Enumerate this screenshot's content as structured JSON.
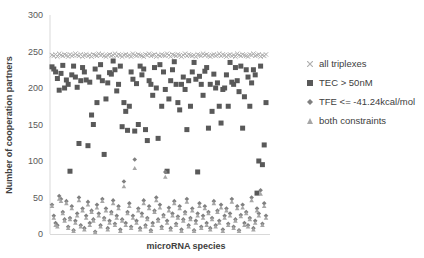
{
  "chart_data": {
    "type": "scatter",
    "title": "",
    "xlabel": "microRNA species",
    "ylabel": "Number of cooperation partners",
    "ylim": [
      0,
      300
    ],
    "yticks": [
      0,
      50,
      100,
      150,
      200,
      250,
      300
    ],
    "grid": false,
    "legend_position": "right",
    "x_count": 120,
    "series": [
      {
        "name": "all triplexes",
        "marker": "x",
        "color": "#b0b0b0",
        "y": [
          245,
          244,
          246,
          243,
          247,
          245,
          244,
          246,
          245,
          243,
          246,
          244,
          245,
          247,
          245,
          244,
          246,
          243,
          245,
          246,
          244,
          245,
          243,
          246,
          245,
          244,
          247,
          245,
          246,
          244,
          243,
          245,
          246,
          244,
          245,
          247,
          244,
          246,
          245,
          243,
          245,
          246,
          244,
          245,
          243,
          247,
          245,
          244,
          246,
          245,
          244,
          243,
          246,
          245,
          247,
          244,
          245,
          246,
          243,
          245,
          244,
          246,
          245,
          244,
          247,
          245,
          243,
          246,
          245,
          244,
          246,
          245,
          243,
          245,
          247,
          244,
          246,
          245,
          244,
          245,
          243,
          246,
          245,
          244,
          247,
          245,
          246,
          244,
          243,
          245,
          246,
          244,
          245,
          247,
          244,
          246,
          245,
          243,
          245,
          246,
          244,
          245,
          243,
          247,
          245,
          244,
          246,
          245,
          244,
          243,
          246,
          245,
          247,
          244,
          245,
          246,
          243,
          245,
          244,
          246
        ]
      },
      {
        "name": "TEC > 50nM",
        "marker": "square",
        "color": "#595959",
        "y": [
          229,
          226,
          222,
          213,
          197,
          220,
          231,
          200,
          211,
          205,
          86,
          218,
          230,
          215,
          201,
          124,
          210,
          228,
          222,
          211,
          121,
          208,
          163,
          150,
          226,
          180,
          215,
          232,
          210,
          109,
          185,
          207,
          221,
          219,
          237,
          225,
          196,
          205,
          230,
          147,
          180,
          168,
          142,
          175,
          222,
          212,
          141,
          206,
          150,
          230,
          218,
          226,
          143,
          128,
          210,
          205,
          190,
          228,
          200,
          131,
          232,
          175,
          222,
          198,
          86,
          185,
          210,
          225,
          236,
          205,
          180,
          170,
          205,
          215,
          198,
          143,
          210,
          175,
          222,
          235,
          212,
          85,
          216,
          205,
          190,
          223,
          228,
          145,
          205,
          168,
          219,
          200,
          207,
          175,
          152,
          198,
          200,
          218,
          175,
          235,
          208,
          205,
          228,
          210,
          195,
          230,
          145,
          188,
          225,
          215,
          175,
          207,
          225,
          218,
          56,
          100,
          230,
          95,
          122,
          180
        ]
      },
      {
        "name": "TFE <= -41.24kcal/mol",
        "marker": "diamond",
        "color": "#7f7f7f",
        "y": [
          40,
          25,
          15,
          12,
          52,
          48,
          30,
          20,
          45,
          10,
          22,
          38,
          5,
          18,
          28,
          50,
          12,
          35,
          8,
          25,
          44,
          15,
          32,
          20,
          3,
          40,
          28,
          12,
          48,
          22,
          35,
          8,
          18,
          30,
          46,
          14,
          25,
          38,
          6,
          20,
          72,
          15,
          30,
          42,
          10,
          25,
          102,
          18,
          35,
          8,
          28,
          46,
          12,
          22,
          38,
          5,
          15,
          32,
          50,
          20,
          40,
          10,
          26,
          85,
          18,
          36,
          8,
          28,
          45,
          14,
          24,
          38,
          6,
          20,
          30,
          48,
          12,
          22,
          35,
          5,
          18,
          28,
          42,
          10,
          25,
          38,
          15,
          30,
          8,
          22,
          45,
          12,
          32,
          18,
          40,
          6,
          25,
          35,
          14,
          28,
          48,
          10,
          20,
          38,
          5,
          26,
          40,
          15,
          30,
          12,
          22,
          50,
          8,
          18,
          35,
          28,
          60,
          14,
          42,
          25
        ]
      },
      {
        "name": "both constraints",
        "marker": "triangle",
        "color": "#a6a6a6",
        "y": [
          38,
          22,
          12,
          10,
          48,
          45,
          28,
          18,
          42,
          8,
          20,
          35,
          4,
          15,
          25,
          46,
          10,
          32,
          6,
          22,
          40,
          12,
          30,
          18,
          2,
          36,
          25,
          10,
          45,
          20,
          32,
          6,
          15,
          28,
          42,
          12,
          22,
          35,
          4,
          18,
          65,
          12,
          28,
          38,
          8,
          22,
          90,
          15,
          32,
          6,
          25,
          42,
          10,
          20,
          35,
          4,
          12,
          30,
          46,
          18,
          36,
          8,
          24,
          78,
          15,
          32,
          6,
          25,
          42,
          12,
          22,
          35,
          4,
          18,
          28,
          44,
          10,
          20,
          32,
          4,
          15,
          25,
          38,
          8,
          22,
          35,
          12,
          28,
          6,
          20,
          42,
          10,
          30,
          15,
          36,
          4,
          22,
          32,
          12,
          25,
          44,
          8,
          18,
          35,
          4,
          24,
          36,
          12,
          28,
          10,
          20,
          46,
          6,
          15,
          32,
          25,
          55,
          12,
          38,
          22
        ]
      }
    ]
  },
  "legend": {
    "items": [
      {
        "label": "all triplexes"
      },
      {
        "label": "TEC > 50nM"
      },
      {
        "label": "TFE <= -41.24kcal/mol"
      },
      {
        "label": "both constraints"
      }
    ]
  }
}
